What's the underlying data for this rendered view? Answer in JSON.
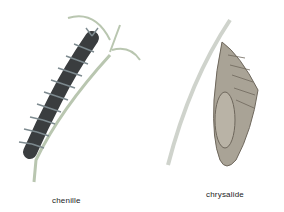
{
  "figures": [
    {
      "id": "caterpillar",
      "label": "chenille"
    },
    {
      "id": "chrysalis",
      "label": "chrysalide"
    }
  ],
  "colors": {
    "stem": "#b9c6b0",
    "caterpillar_body": "#3a3d3f",
    "caterpillar_spines": "#7d8a8f",
    "chrysalis_body": "#9a958c",
    "chrysalis_dark": "#6e675c"
  }
}
